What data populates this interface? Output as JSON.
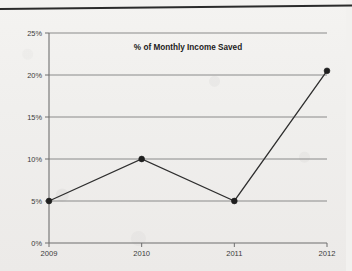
{
  "document": {
    "background_color": "#f1f0ee",
    "rule_color": "#2b2b2b"
  },
  "chart_data": {
    "type": "line",
    "title": "% of Monthly Income Saved",
    "xlabel": "",
    "ylabel": "",
    "categories": [
      "2009",
      "2010",
      "2011",
      "2012"
    ],
    "values": [
      5,
      10,
      5,
      20.5
    ],
    "y_ticks": [
      "0%",
      "5%",
      "10%",
      "15%",
      "20%",
      "25%"
    ],
    "y_tick_values": [
      0,
      5,
      10,
      15,
      20,
      25
    ],
    "ylim": [
      0,
      25
    ],
    "grid": true,
    "legend": "none",
    "series": [
      {
        "name": "% of Monthly Income Saved",
        "values": [
          5,
          10,
          5,
          20.5
        ],
        "line_color": "#2e2e2e",
        "marker_color": "#1f1f1f",
        "marker": "circle"
      }
    ],
    "grid_color": "#8a8a8a",
    "axis_color": "#6f6f6f"
  }
}
